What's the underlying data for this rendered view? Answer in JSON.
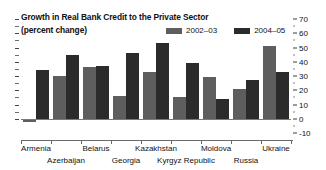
{
  "chart_data": {
    "type": "bar",
    "title": "Growth in Real Bank Credit to the Private Sector",
    "subtitle": "(percent change)",
    "xlabel": "",
    "ylabel": "",
    "ylim": [
      -10,
      70
    ],
    "yticks": [
      -10,
      0,
      10,
      20,
      30,
      40,
      50,
      60,
      70
    ],
    "ytick_labels": [
      "-10",
      "0",
      "10",
      "20",
      "30",
      "40",
      "50",
      "60",
      "70"
    ],
    "grid": false,
    "legend_position": "top-right",
    "axis_side": "right",
    "categories": [
      "Armenia",
      "Azerbaijan",
      "Belarus",
      "Georgia",
      "Kazakhstan",
      "Kyrgyz Republic",
      "Moldova",
      "Russia",
      "Ukraine"
    ],
    "series": [
      {
        "name": "2002–03",
        "color": "#5e5e5e",
        "values": [
          -2,
          30,
          36,
          16,
          33,
          15,
          29,
          21,
          51
        ]
      },
      {
        "name": "2004–05",
        "color": "#2b2b2b",
        "values": [
          34,
          45,
          37,
          46,
          53,
          39,
          14,
          27,
          33
        ]
      }
    ]
  },
  "title_lines": [
    "Growth in Real Bank Credit to the Private Sector",
    "(percent change)"
  ],
  "legend": {
    "entries": [
      {
        "label": "2002–03",
        "color": "#5e5e5e"
      },
      {
        "label": "2004–05",
        "color": "#2b2b2b"
      }
    ]
  }
}
